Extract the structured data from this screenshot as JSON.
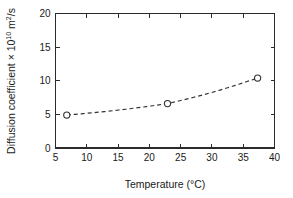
{
  "chart_data": {
    "type": "line",
    "title": "",
    "subtitle": "",
    "xlabel": "Temperature (°C)",
    "ylabel": "Diffusion coefficient × 10",
    "ylabel_exponent": "10",
    "ylabel_tail": " m",
    "ylabel_unit_exponent": "2",
    "ylabel_unit_tail": "/s",
    "xlim": [
      5,
      40
    ],
    "ylim": [
      0,
      20
    ],
    "xticks": [
      5,
      10,
      15,
      20,
      25,
      30,
      35,
      40
    ],
    "yticks": [
      0,
      5,
      10,
      15,
      20
    ],
    "xtick_labels": [
      "5",
      "10",
      "15",
      "20",
      "25",
      "30",
      "35",
      "40"
    ],
    "ytick_labels": [
      "0",
      "5",
      "10",
      "15",
      "20"
    ],
    "grid": false,
    "legend": false,
    "legend_position": "none",
    "marker": "open-circle",
    "linestyle": "dashed",
    "line_color": "#333333",
    "marker_face_color": "#ffffff",
    "marker_edge_color": "#333333",
    "axis_color": "#2b2b2b",
    "background_color": "#ffffff",
    "x": [
      6.8,
      22.9,
      37.3
    ],
    "values": [
      4.9,
      6.6,
      10.4
    ],
    "series": [
      {
        "name": "Diffusion coefficient",
        "x": [
          6.8,
          22.9,
          37.3
        ],
        "values": [
          4.9,
          6.6,
          10.4
        ]
      }
    ],
    "annotations": []
  },
  "axis_titles": {
    "x": "Temperature (°C)",
    "y_prefix": "Diffusion coefficient × 10",
    "y_exp": "10",
    "y_mid": " m",
    "y_unit_exp": "2",
    "y_suffix": "/s"
  }
}
